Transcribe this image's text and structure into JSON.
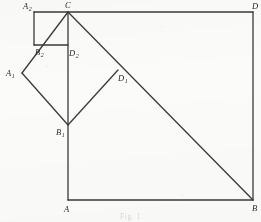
{
  "figure": {
    "caption": "Fig. 1",
    "stroke_color": "#3a3a3a",
    "background_color": "#fbfbfa",
    "canvas": {
      "width": 261,
      "height": 222
    },
    "vertices": [
      {
        "id": "A",
        "label": "A",
        "sub": "",
        "x": 68,
        "y": 200,
        "label_x": 64,
        "label_y": 205
      },
      {
        "id": "B",
        "label": "B",
        "sub": "",
        "x": 253,
        "y": 200,
        "label_x": 252,
        "label_y": 204
      },
      {
        "id": "C",
        "label": "C",
        "sub": "",
        "x": 68,
        "y": 12,
        "label_x": 65,
        "label_y": 1
      },
      {
        "id": "D",
        "label": "D",
        "sub": "",
        "x": 253,
        "y": 12,
        "label_x": 252,
        "label_y": 2
      },
      {
        "id": "A1",
        "label": "A",
        "sub": "1",
        "x": 22,
        "y": 73,
        "label_x": 6,
        "label_y": 69
      },
      {
        "id": "B1",
        "label": "B",
        "sub": "1",
        "x": 68,
        "y": 125,
        "label_x": 56,
        "label_y": 128
      },
      {
        "id": "D1",
        "label": "D",
        "sub": "1",
        "x": 118,
        "y": 70,
        "label_x": 118,
        "label_y": 74
      },
      {
        "id": "A2",
        "label": "A",
        "sub": "2",
        "x": 34,
        "y": 12,
        "label_x": 23,
        "label_y": 2
      },
      {
        "id": "B2",
        "label": "B",
        "sub": "2",
        "x": 34,
        "y": 45,
        "label_x": 35,
        "label_y": 48
      },
      {
        "id": "D2",
        "label": "D",
        "sub": "2",
        "x": 68,
        "y": 45,
        "label_x": 69,
        "label_y": 49
      }
    ],
    "segments": [
      {
        "name": "square-side-CD-top",
        "x1": 68,
        "y1": 12,
        "x2": 253,
        "y2": 12,
        "weight": 1.3
      },
      {
        "name": "square-side-DB-right",
        "x1": 253,
        "y1": 12,
        "x2": 253,
        "y2": 200,
        "weight": 1.3
      },
      {
        "name": "square-side-AB-bottom",
        "x1": 68,
        "y1": 200,
        "x2": 253,
        "y2": 200,
        "weight": 1.3
      },
      {
        "name": "square-side-CA-left",
        "x1": 68,
        "y1": 12,
        "x2": 68,
        "y2": 200,
        "weight": 1.3
      },
      {
        "name": "diagonal-C-to-B",
        "x1": 68,
        "y1": 12,
        "x2": 253,
        "y2": 200,
        "weight": 1.3
      },
      {
        "name": "diamond-side-C-A1",
        "x1": 68,
        "y1": 12,
        "x2": 22,
        "y2": 73,
        "weight": 1.3
      },
      {
        "name": "diamond-side-A1-B1",
        "x1": 22,
        "y1": 73,
        "x2": 68,
        "y2": 125,
        "weight": 1.3
      },
      {
        "name": "diamond-side-B1-D1",
        "x1": 68,
        "y1": 125,
        "x2": 118,
        "y2": 70,
        "weight": 1.3
      },
      {
        "name": "small-square-side-A2-C",
        "x1": 34,
        "y1": 12,
        "x2": 68,
        "y2": 12,
        "weight": 1.3
      },
      {
        "name": "small-square-side-A2-B2",
        "x1": 34,
        "y1": 12,
        "x2": 34,
        "y2": 45,
        "weight": 1.3
      },
      {
        "name": "small-square-side-B2-D2",
        "x1": 34,
        "y1": 45,
        "x2": 68,
        "y2": 45,
        "weight": 1.3
      }
    ]
  },
  "chart_data": {
    "type": "diagram"
  }
}
